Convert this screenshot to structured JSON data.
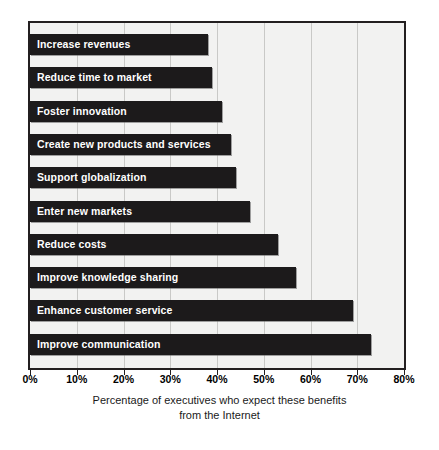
{
  "chart_data": {
    "type": "bar",
    "orientation": "horizontal",
    "title": "",
    "xlabel": "Percentage of executives who expect these benefits from the Internet",
    "ylabel": "",
    "xlim": [
      0,
      80
    ],
    "xtick_values": [
      0,
      10,
      20,
      30,
      40,
      50,
      60,
      70,
      80
    ],
    "xtick_labels": [
      "0%",
      "10%",
      "20%",
      "30%",
      "40%",
      "50%",
      "60%",
      "70%",
      "80%"
    ],
    "grid": true,
    "legend": null,
    "categories": [
      "Increase revenues",
      "Reduce time to market",
      "Foster innovation",
      "Create new products and services",
      "Support globalization",
      "Enter new markets",
      "Reduce costs",
      "Improve knowledge sharing",
      "Enhance customer service",
      "Improve communication"
    ],
    "values": [
      38,
      39,
      41,
      43,
      44,
      47,
      53,
      57,
      69,
      73
    ],
    "bar_color": "#1c1a1b",
    "plot_background": "#f2f2f1",
    "gridline_color": "#c9c9c7",
    "frame_color": "#231f20",
    "bar_label_color": "#ffffff"
  },
  "caption": {
    "line1": "Percentage of executives who expect these benefits",
    "line2": "from the Internet"
  }
}
